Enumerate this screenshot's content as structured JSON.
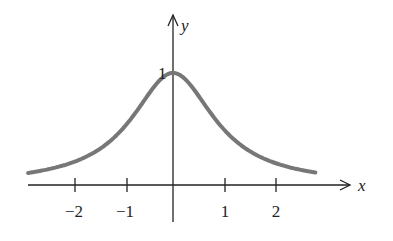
{
  "chart_data": {
    "type": "line",
    "title": "",
    "function": "y = 1/(1+x^2)",
    "xlabel": "x",
    "ylabel": "y",
    "xlim": [
      -2.85,
      3.4
    ],
    "ylim": [
      0,
      1.0
    ],
    "x_ticks": [
      -2,
      -1,
      1,
      2
    ],
    "x_tick_labels": [
      "−2",
      "−1",
      "1",
      "2"
    ],
    "y_ticks": [
      1
    ],
    "y_tick_labels": [
      "1"
    ],
    "grid": false,
    "legend": null,
    "series": [
      {
        "name": "curve",
        "color": "#777777",
        "x": [
          -2.8,
          -2.5,
          -2,
          -1.5,
          -1,
          -0.5,
          0,
          0.5,
          1,
          1.5,
          2,
          2.5,
          2.8
        ],
        "y": [
          0.113,
          0.138,
          0.2,
          0.308,
          0.5,
          0.8,
          1.0,
          0.8,
          0.5,
          0.308,
          0.2,
          0.138,
          0.113
        ]
      }
    ]
  },
  "labels": {
    "x_axis": "x",
    "y_axis": "y",
    "peak": "1",
    "ticks": [
      "−2",
      "−1",
      "1",
      "2"
    ]
  }
}
